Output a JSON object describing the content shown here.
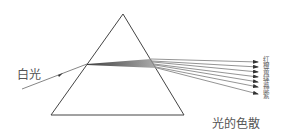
{
  "diagram": {
    "title": "光的色散",
    "incident_label": "白光",
    "spectrum_labels": [
      "红",
      "橙",
      "黄",
      "绿",
      "蓝",
      "靛",
      "紫"
    ],
    "colors": {
      "line": "#444444",
      "ray": "#666666",
      "text": "#555555"
    },
    "prism": {
      "apex": [
        123,
        14
      ],
      "bottom_left": [
        51,
        115
      ],
      "bottom_right": [
        184,
        115
      ]
    },
    "incident_ray": {
      "from": [
        22,
        89
      ],
      "to": [
        87,
        64
      ]
    },
    "rays": [
      {
        "exit": [
          151,
          59
        ],
        "end": [
          258,
          62
        ]
      },
      {
        "exit": [
          152,
          61
        ],
        "end": [
          258,
          67
        ]
      },
      {
        "exit": [
          153,
          62
        ],
        "end": [
          258,
          72
        ]
      },
      {
        "exit": [
          154,
          64
        ],
        "end": [
          258,
          77
        ]
      },
      {
        "exit": [
          155,
          65
        ],
        "end": [
          258,
          82
        ]
      },
      {
        "exit": [
          156,
          67
        ],
        "end": [
          258,
          87
        ]
      },
      {
        "exit": [
          157,
          68
        ],
        "end": [
          258,
          94
        ]
      }
    ]
  }
}
